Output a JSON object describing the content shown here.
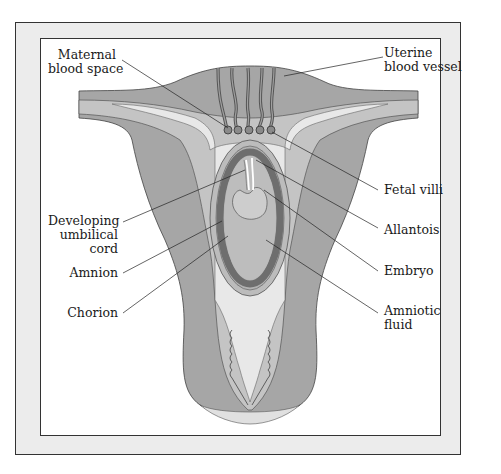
{
  "diagram": {
    "colors": {
      "uterine_wall": "#a6a6a6",
      "endometrium": "#c4c4c4",
      "cavity": "#e8e8e8",
      "chorion_ring": "#6e6e6e",
      "amniotic_fluid": "#bdbdbd",
      "frame_fill": "#ececec",
      "line": "#333333"
    },
    "labels": {
      "maternal_blood_space": [
        "Maternal",
        "blood space"
      ],
      "uterine_blood_vessel": [
        "Uterine",
        "blood vessel"
      ],
      "fetal_villi": [
        "Fetal villi"
      ],
      "developing_umbilical_cord": [
        "Developing",
        "umbilical",
        "cord"
      ],
      "allantois": [
        "Allantois"
      ],
      "amnion": [
        "Amnion"
      ],
      "embryo": [
        "Embryo"
      ],
      "chorion": [
        "Chorion"
      ],
      "amniotic_fluid": [
        "Amniotic",
        "fluid"
      ]
    }
  }
}
